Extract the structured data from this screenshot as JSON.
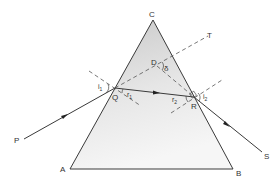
{
  "diagram": {
    "vertices": {
      "C": "C",
      "A": "A",
      "B": "B"
    },
    "points": {
      "P": "P",
      "Q": "Q",
      "R": "R",
      "S": "S",
      "T": "T",
      "D": "D"
    },
    "angles": {
      "i1": {
        "base": "i",
        "sub": "1"
      },
      "r1": {
        "base": "r",
        "sub": "1"
      },
      "r2": {
        "base": "r",
        "sub": "2"
      },
      "i2": {
        "base": "i",
        "sub": "2"
      },
      "delta": "δ"
    },
    "colors": {
      "line": "#3a3a3a",
      "prism_fill_top": "#cfcfcf",
      "prism_fill_bottom": "#f4f4f4",
      "label": "#333333"
    }
  }
}
